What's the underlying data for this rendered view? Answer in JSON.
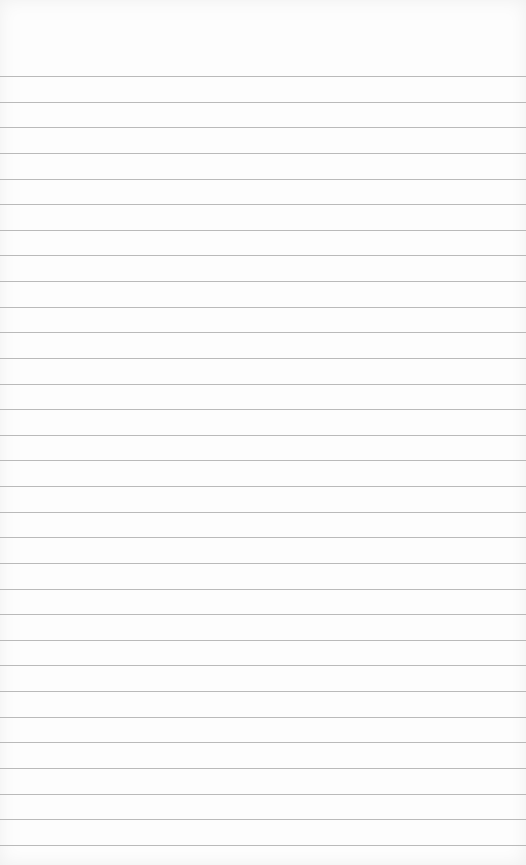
{
  "paper": {
    "type": "ruled-notebook-paper",
    "background_color": "#fdfdfd",
    "line_color": "#a9a9a9",
    "line_count": 31,
    "first_line_y": 76,
    "line_spacing": 25.63
  }
}
